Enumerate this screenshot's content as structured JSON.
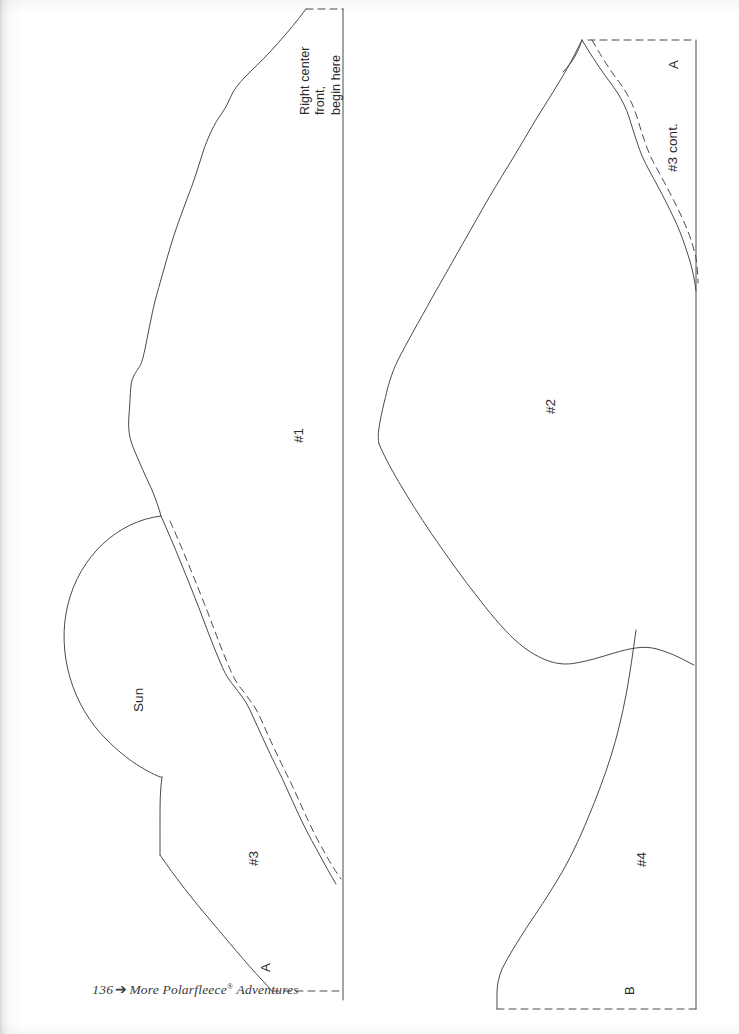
{
  "page": {
    "kind": "scanned-book-page",
    "width": 739,
    "height": 1034,
    "background_color": "#ffffff",
    "ink_color": "#4a4a4a",
    "text_color": "#2b2b2b"
  },
  "footer": {
    "folio": "136",
    "dingbat": "➔",
    "title": "More Polarfleece",
    "registered": "®",
    "title_suffix": " Adventures"
  },
  "left_panel": {
    "notes": {
      "right_center_front": "Right center\nfront,\nbegin here"
    },
    "pieces": [
      {
        "label": "#1",
        "x": 291,
        "y": 435
      },
      {
        "label": "#3",
        "x": 246,
        "y": 858
      }
    ],
    "motif": {
      "label": "Sun",
      "x": 131,
      "y": 700
    },
    "match_marks": [
      {
        "label": "A",
        "x": 258,
        "y": 966
      }
    ]
  },
  "right_panel": {
    "pieces": [
      {
        "label": "#2",
        "x": 543,
        "y": 406
      },
      {
        "label": "#3 cont.",
        "x": 665,
        "y": 145
      },
      {
        "label": "#4",
        "x": 634,
        "y": 859
      }
    ],
    "match_marks": [
      {
        "label": "A",
        "x": 666,
        "y": 63
      },
      {
        "label": "B",
        "x": 622,
        "y": 989
      }
    ]
  },
  "line_styles": {
    "cutting_line": "solid",
    "seam_allowance_line": "dashed",
    "stroke_width": "1"
  }
}
